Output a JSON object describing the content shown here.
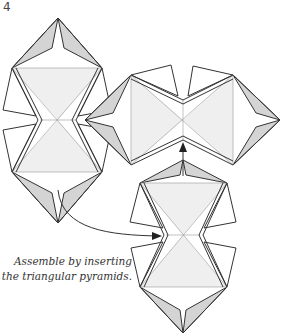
{
  "diagram": {
    "step_number": "4",
    "caption_line1": "Assemble by inserting",
    "caption_line2": "the triangular pyramids.",
    "colors": {
      "line": "#333333",
      "shade": "#d4d4d4",
      "background": "#ffffff"
    }
  }
}
